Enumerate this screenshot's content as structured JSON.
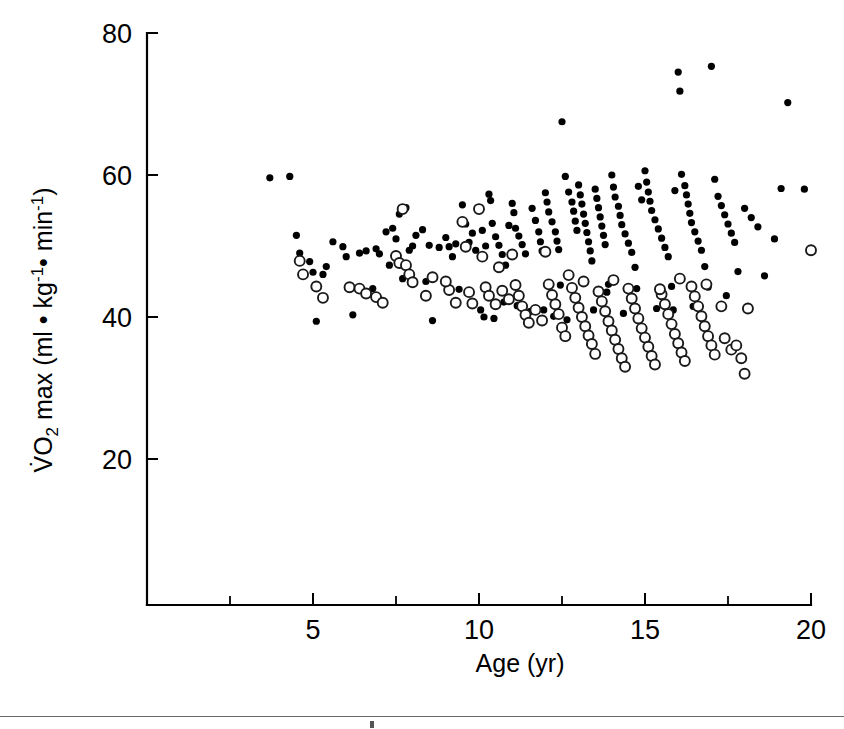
{
  "figure": {
    "background_color": "#ffffff",
    "ink_color": "#000000",
    "rule_color": "#6a6a6a"
  },
  "axes": {
    "x_title": "Age (yr)",
    "y_title_parts": {
      "v_dot": "V̇",
      "o": "O",
      "two": "2",
      "max": " max (ml ",
      "bullet1": "•",
      "kg": " kg",
      "exp1": "-1",
      "bullet2": "•",
      "min": " min",
      "exp2": "-1",
      "close": ")"
    },
    "y_title_plain": "VO2 max (ml • kg-1 • min-1)",
    "x_tick_labels": [
      "5",
      "10",
      "15",
      "20"
    ],
    "x_tick_values": [
      5,
      10,
      15,
      20
    ],
    "x_minor_tick_values": [
      2.5,
      7.5,
      12.5,
      17.5
    ],
    "y_tick_labels": [
      "20",
      "40",
      "60",
      "80"
    ],
    "y_tick_values": [
      20,
      40,
      60,
      80
    ]
  },
  "chart_data": {
    "type": "scatter",
    "title": "",
    "xlabel": "Age (yr)",
    "ylabel": "VO2 max (ml • kg-1 • min-1)",
    "xlim": [
      0,
      20
    ],
    "ylim": [
      12,
      80
    ],
    "grid": false,
    "legend": "none",
    "marker_styles": {
      "filled": {
        "shape": "circle",
        "fill": "#000000",
        "stroke": "none",
        "radius_px": 3.6
      },
      "open": {
        "shape": "circle",
        "fill": "#ffffff",
        "stroke": "#1a1a1a",
        "radius_px": 5.0
      }
    },
    "series": [
      {
        "name": "filled-circles",
        "marker": "filled",
        "points": [
          [
            3.7,
            59.6
          ],
          [
            4.3,
            59.8
          ],
          [
            4.5,
            51.5
          ],
          [
            4.6,
            49.0
          ],
          [
            5.0,
            46.3
          ],
          [
            5.1,
            39.4
          ],
          [
            5.4,
            47.1
          ],
          [
            5.6,
            50.6
          ],
          [
            5.9,
            49.9
          ],
          [
            6.0,
            48.5
          ],
          [
            6.2,
            40.3
          ],
          [
            6.4,
            49.0
          ],
          [
            6.6,
            49.3
          ],
          [
            6.9,
            49.6
          ],
          [
            7.0,
            48.9
          ],
          [
            7.2,
            52.0
          ],
          [
            7.3,
            47.3
          ],
          [
            7.4,
            52.5
          ],
          [
            7.5,
            51.0
          ],
          [
            7.6,
            54.5
          ],
          [
            7.8,
            55.4
          ],
          [
            7.9,
            49.4
          ],
          [
            8.0,
            50.0
          ],
          [
            8.1,
            51.5
          ],
          [
            8.3,
            52.3
          ],
          [
            8.5,
            50.1
          ],
          [
            8.6,
            39.5
          ],
          [
            8.8,
            49.8
          ],
          [
            9.0,
            51.2
          ],
          [
            9.1,
            49.9
          ],
          [
            9.2,
            48.5
          ],
          [
            9.3,
            50.3
          ],
          [
            9.5,
            55.8
          ],
          [
            9.6,
            53.1
          ],
          [
            9.7,
            50.5
          ],
          [
            9.8,
            51.8
          ],
          [
            9.9,
            49.4
          ],
          [
            10.0,
            55.2
          ],
          [
            10.1,
            52.2
          ],
          [
            10.2,
            50.0
          ],
          [
            10.3,
            57.3
          ],
          [
            10.35,
            56.4
          ],
          [
            10.4,
            53.2
          ],
          [
            10.5,
            51.3
          ],
          [
            10.6,
            50.1
          ],
          [
            10.7,
            48.8
          ],
          [
            10.8,
            47.3
          ],
          [
            10.9,
            52.9
          ],
          [
            11.0,
            56.0
          ],
          [
            11.05,
            54.7
          ],
          [
            11.1,
            52.5
          ],
          [
            11.2,
            51.4
          ],
          [
            11.3,
            50.2
          ],
          [
            11.4,
            48.9
          ],
          [
            11.45,
            40.3
          ],
          [
            11.5,
            39.4
          ],
          [
            11.6,
            55.3
          ],
          [
            11.7,
            53.6
          ],
          [
            11.8,
            52.0
          ],
          [
            11.85,
            50.6
          ],
          [
            11.9,
            49.3
          ],
          [
            12.0,
            57.5
          ],
          [
            12.05,
            56.2
          ],
          [
            12.1,
            54.8
          ],
          [
            12.2,
            53.4
          ],
          [
            12.3,
            52.0
          ],
          [
            12.35,
            50.7
          ],
          [
            12.4,
            49.5
          ],
          [
            12.45,
            44.5
          ],
          [
            12.5,
            67.5
          ],
          [
            12.6,
            59.8
          ],
          [
            12.7,
            57.6
          ],
          [
            12.8,
            56.2
          ],
          [
            12.85,
            54.9
          ],
          [
            12.9,
            53.5
          ],
          [
            12.95,
            52.2
          ],
          [
            13.0,
            58.6
          ],
          [
            13.05,
            57.2
          ],
          [
            13.1,
            55.9
          ],
          [
            13.15,
            54.5
          ],
          [
            13.2,
            53.2
          ],
          [
            13.25,
            51.9
          ],
          [
            13.3,
            50.6
          ],
          [
            13.35,
            49.3
          ],
          [
            13.4,
            47.9
          ],
          [
            13.5,
            58.0
          ],
          [
            13.55,
            56.7
          ],
          [
            13.6,
            55.4
          ],
          [
            13.65,
            54.1
          ],
          [
            13.7,
            52.8
          ],
          [
            13.75,
            51.5
          ],
          [
            13.8,
            50.2
          ],
          [
            13.9,
            44.6
          ],
          [
            14.0,
            60.0
          ],
          [
            14.05,
            58.3
          ],
          [
            14.1,
            56.9
          ],
          [
            14.2,
            55.6
          ],
          [
            14.25,
            54.3
          ],
          [
            14.3,
            53.0
          ],
          [
            14.4,
            51.7
          ],
          [
            14.5,
            50.4
          ],
          [
            14.6,
            49.1
          ],
          [
            14.7,
            47.0
          ],
          [
            14.75,
            44.0
          ],
          [
            14.8,
            58.4
          ],
          [
            14.9,
            56.5
          ],
          [
            15.0,
            60.6
          ],
          [
            15.05,
            59.0
          ],
          [
            15.1,
            57.6
          ],
          [
            15.15,
            56.3
          ],
          [
            15.2,
            55.0
          ],
          [
            15.3,
            53.7
          ],
          [
            15.4,
            52.4
          ],
          [
            15.5,
            51.1
          ],
          [
            15.6,
            49.8
          ],
          [
            15.7,
            48.5
          ],
          [
            15.8,
            44.3
          ],
          [
            15.9,
            57.8
          ],
          [
            16.0,
            74.5
          ],
          [
            16.05,
            71.8
          ],
          [
            16.1,
            60.1
          ],
          [
            16.2,
            58.5
          ],
          [
            16.25,
            57.2
          ],
          [
            16.3,
            55.9
          ],
          [
            16.35,
            54.6
          ],
          [
            16.4,
            53.3
          ],
          [
            16.5,
            52.0
          ],
          [
            16.6,
            50.7
          ],
          [
            16.7,
            49.4
          ],
          [
            16.8,
            47.1
          ],
          [
            16.9,
            44.2
          ],
          [
            17.0,
            75.3
          ],
          [
            17.1,
            59.4
          ],
          [
            17.2,
            57.0
          ],
          [
            17.3,
            55.7
          ],
          [
            17.4,
            54.4
          ],
          [
            17.5,
            53.1
          ],
          [
            17.6,
            51.8
          ],
          [
            17.7,
            50.5
          ],
          [
            17.8,
            46.4
          ],
          [
            18.0,
            55.3
          ],
          [
            18.2,
            54.0
          ],
          [
            18.4,
            52.7
          ],
          [
            18.6,
            45.8
          ],
          [
            18.9,
            51.0
          ],
          [
            19.1,
            58.1
          ],
          [
            19.3,
            70.2
          ],
          [
            19.8,
            58.0
          ],
          [
            4.9,
            47.8
          ],
          [
            5.3,
            46.0
          ],
          [
            6.8,
            44.0
          ],
          [
            7.7,
            45.4
          ],
          [
            8.4,
            45.0
          ],
          [
            9.4,
            43.9
          ],
          [
            10.05,
            41.0
          ],
          [
            10.15,
            40.0
          ],
          [
            10.45,
            39.8
          ],
          [
            10.75,
            42.1
          ],
          [
            11.15,
            41.6
          ],
          [
            11.55,
            40.8
          ],
          [
            11.95,
            41.0
          ],
          [
            12.25,
            40.1
          ],
          [
            12.65,
            39.6
          ],
          [
            13.45,
            41.0
          ],
          [
            13.85,
            43.5
          ],
          [
            14.35,
            40.5
          ],
          [
            15.35,
            41.2
          ],
          [
            15.85,
            41.0
          ],
          [
            16.45,
            41.5
          ],
          [
            17.45,
            43.0
          ]
        ]
      },
      {
        "name": "open-circles",
        "marker": "open",
        "points": [
          [
            4.6,
            47.9
          ],
          [
            4.7,
            46.0
          ],
          [
            5.1,
            44.3
          ],
          [
            5.3,
            42.7
          ],
          [
            6.1,
            44.2
          ],
          [
            6.4,
            44.0
          ],
          [
            6.6,
            43.3
          ],
          [
            6.9,
            42.8
          ],
          [
            7.1,
            42.0
          ],
          [
            7.5,
            48.6
          ],
          [
            7.6,
            47.6
          ],
          [
            7.7,
            55.2
          ],
          [
            7.8,
            47.3
          ],
          [
            7.9,
            46.0
          ],
          [
            8.0,
            44.9
          ],
          [
            8.4,
            43.0
          ],
          [
            9.1,
            43.8
          ],
          [
            9.3,
            42.0
          ],
          [
            9.5,
            53.4
          ],
          [
            9.6,
            49.9
          ],
          [
            9.7,
            43.5
          ],
          [
            9.8,
            41.9
          ],
          [
            10.0,
            55.2
          ],
          [
            10.1,
            48.5
          ],
          [
            10.2,
            44.2
          ],
          [
            10.3,
            43.0
          ],
          [
            10.5,
            41.8
          ],
          [
            10.7,
            43.7
          ],
          [
            10.9,
            42.5
          ],
          [
            11.0,
            48.8
          ],
          [
            11.1,
            44.5
          ],
          [
            11.2,
            43.0
          ],
          [
            11.3,
            41.5
          ],
          [
            11.4,
            40.3
          ],
          [
            11.5,
            39.2
          ],
          [
            11.7,
            41.0
          ],
          [
            11.9,
            39.5
          ],
          [
            12.0,
            49.2
          ],
          [
            12.1,
            44.6
          ],
          [
            12.2,
            43.1
          ],
          [
            12.3,
            41.8
          ],
          [
            12.4,
            40.4
          ],
          [
            12.5,
            38.5
          ],
          [
            12.6,
            37.3
          ],
          [
            12.8,
            44.1
          ],
          [
            12.9,
            42.7
          ],
          [
            13.0,
            41.3
          ],
          [
            13.1,
            40.0
          ],
          [
            13.2,
            38.7
          ],
          [
            13.3,
            37.4
          ],
          [
            13.4,
            36.2
          ],
          [
            13.5,
            34.8
          ],
          [
            13.6,
            43.6
          ],
          [
            13.7,
            42.2
          ],
          [
            13.8,
            40.8
          ],
          [
            13.9,
            39.4
          ],
          [
            14.0,
            38.1
          ],
          [
            14.1,
            36.8
          ],
          [
            14.2,
            35.5
          ],
          [
            14.3,
            34.2
          ],
          [
            14.4,
            33.0
          ],
          [
            14.5,
            44.0
          ],
          [
            14.6,
            42.6
          ],
          [
            14.7,
            41.2
          ],
          [
            14.8,
            39.8
          ],
          [
            14.9,
            38.4
          ],
          [
            15.0,
            37.1
          ],
          [
            15.1,
            35.8
          ],
          [
            15.2,
            34.5
          ],
          [
            15.3,
            33.3
          ],
          [
            15.5,
            43.2
          ],
          [
            15.6,
            41.8
          ],
          [
            15.7,
            40.4
          ],
          [
            15.8,
            39.0
          ],
          [
            15.9,
            37.6
          ],
          [
            16.0,
            36.3
          ],
          [
            16.1,
            35.0
          ],
          [
            16.2,
            33.8
          ],
          [
            16.4,
            44.3
          ],
          [
            16.5,
            42.9
          ],
          [
            16.6,
            41.5
          ],
          [
            16.7,
            40.1
          ],
          [
            16.8,
            38.7
          ],
          [
            16.9,
            37.3
          ],
          [
            17.0,
            36.0
          ],
          [
            17.1,
            34.7
          ],
          [
            17.3,
            41.5
          ],
          [
            17.4,
            37.0
          ],
          [
            17.6,
            35.4
          ],
          [
            17.9,
            34.2
          ],
          [
            18.0,
            32.0
          ],
          [
            18.1,
            41.2
          ],
          [
            20.0,
            49.4
          ],
          [
            8.6,
            45.6
          ],
          [
            9.0,
            45.0
          ],
          [
            10.6,
            47.0
          ],
          [
            12.7,
            45.9
          ],
          [
            13.15,
            45.0
          ],
          [
            14.05,
            45.2
          ],
          [
            15.45,
            43.9
          ],
          [
            16.05,
            45.4
          ],
          [
            16.85,
            44.6
          ],
          [
            17.75,
            36.0
          ]
        ]
      }
    ]
  },
  "geometry": {
    "plot_left_px": 147,
    "plot_right_px": 811,
    "plot_bottom_px": 605,
    "y_80_px": 33,
    "y_20_px": 459,
    "px_per_year": 33.2,
    "px_per_vo2_unit": 7.1
  }
}
